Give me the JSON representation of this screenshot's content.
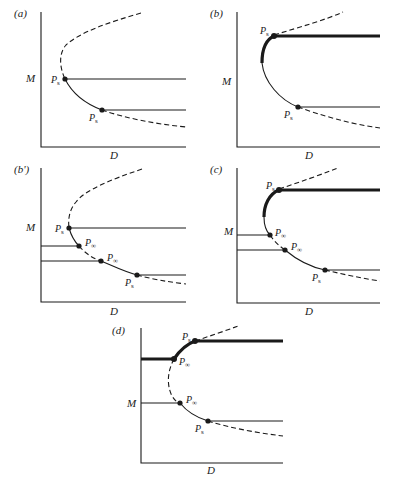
{
  "figure": {
    "panels": [
      {
        "id": "a",
        "label": "(a)",
        "y_axis": "M",
        "x_axis": "D",
        "points": [
          {
            "name": "P",
            "sub": "s"
          },
          {
            "name": "P",
            "sub": "s"
          }
        ]
      },
      {
        "id": "b",
        "label": "(b)",
        "y_axis": "M",
        "x_axis": "D",
        "points": [
          {
            "name": "P",
            "sub": "s"
          },
          {
            "name": "P",
            "sub": "s"
          }
        ]
      },
      {
        "id": "b2",
        "label": "(b')",
        "y_axis": "M",
        "x_axis": "D",
        "points": [
          {
            "name": "P",
            "sub": "s"
          },
          {
            "name": "P",
            "sub": "∞"
          },
          {
            "name": "P",
            "sub": "∞"
          },
          {
            "name": "P",
            "sub": "s"
          }
        ]
      },
      {
        "id": "c",
        "label": "(c)",
        "y_axis": "M",
        "x_axis": "D",
        "points": [
          {
            "name": "P",
            "sub": "s"
          },
          {
            "name": "P",
            "sub": "∞"
          },
          {
            "name": "P",
            "sub": "∞"
          },
          {
            "name": "P",
            "sub": "s"
          }
        ]
      },
      {
        "id": "d",
        "label": "(d)",
        "y_axis": "M",
        "x_axis": "D",
        "points": [
          {
            "name": "P",
            "sub": "s"
          },
          {
            "name": "P",
            "sub": "∞"
          },
          {
            "name": "P",
            "sub": "∞"
          },
          {
            "name": "P",
            "sub": "s"
          }
        ]
      }
    ]
  },
  "colors": {
    "ink": "#1a1a1a",
    "background": "#ffffff"
  }
}
